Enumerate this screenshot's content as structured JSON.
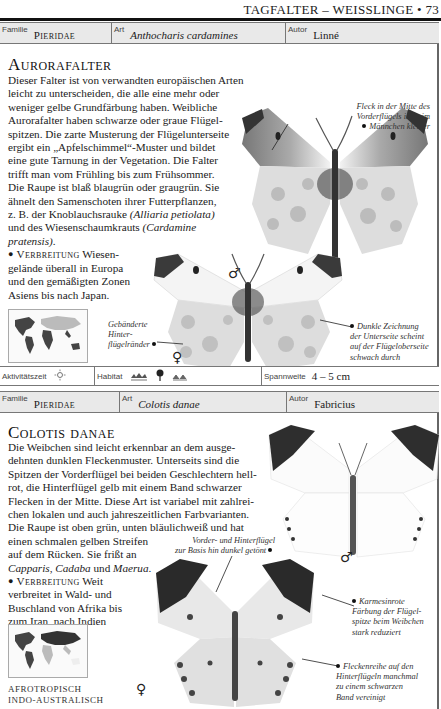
{
  "running_head": "TAGFALTER – WEISSLINGE • 73",
  "entries": [
    {
      "info_bar": {
        "familie_label": "Familie",
        "familie_value": "Pieridae",
        "art_label": "Art",
        "art_value": "Anthocharis cardamines",
        "autor_label": "Autor",
        "autor_value": "Linné"
      },
      "title": "Aurorafalter",
      "body_lines": [
        "Dieser Falter ist von verwandten europäischen Arten",
        "leicht zu unterscheiden, die alle eine mehr oder",
        "weniger gelbe Grundfärbung haben. Weibliche",
        "Aurorafalter haben schwarze oder graue Flügel-",
        "spitzen. Die zarte Musterung der Flügelunterseite",
        "ergibt ein „Apfelschimmel“-Muster und bildet",
        "eine gute Tarnung in der Vegetation. Die Falter",
        "trifft man vom Frühling bis zum Frühsommer.",
        "Die Raupe ist blaß blaugrün oder graugrün. Sie",
        "ähnelt den Samenschoten ihrer Futterpflanzen,"
      ],
      "body_line_11_pre": "z. B. der Knoblauchsrauke ",
      "body_line_11_ital": "(Alliaria petiolata)",
      "body_line_12_pre": "und des Wiesenschaumkrauts ",
      "body_line_12_ital": "(Cardamine",
      "body_line_13_ital": "pratensis)",
      "body_line_13_post": ".",
      "verbreitung_label": "Verbreitung",
      "verbreitung_lines": [
        " Wiesen-",
        "gelände überall in Europa",
        "und den gemäßigten Zonen",
        "Asiens bis nach Japan."
      ],
      "map_label_lines": [
        "PALÄARKTISCH"
      ],
      "captions": {
        "male_spot": [
          "Fleck in der Mitte des",
          "Vorderflügels ist beim",
          "Männchen kleiner"
        ],
        "hindwing_bands": [
          "Gebänderte",
          "Hinter-",
          "flügelränder"
        ],
        "dark_marking": [
          "Dunkle Zeichnung",
          "der Unterseite scheint",
          "auf der Flügeloberseite",
          "schwach durch"
        ]
      },
      "male_symbol": "♂",
      "female_symbol": "♀",
      "footer": {
        "aktivitaet_label": "Aktivitätszeit",
        "aktivitaet_icon": "sun-icon",
        "habitat_label": "Habitat",
        "habitat_icons": [
          "wetland-icon",
          "tree-icon",
          "grassland-icon"
        ],
        "spannweite_label": "Spannweite",
        "spannweite_value": "4 – 5 cm"
      }
    },
    {
      "info_bar": {
        "familie_label": "Familie",
        "familie_value": "Pieridae",
        "art_label": "Art",
        "art_value": "Colotis danae",
        "autor_label": "Autor",
        "autor_value": "Fabricius"
      },
      "title": "Colotis danae",
      "body_lines": [
        "Die Weibchen sind leicht erkennbar an dem ausge-",
        "dehnten dunklen Fleckenmuster. Unterseits sind die",
        "Spitzen der Vorderflügel bei beiden Geschlechtern hell-",
        "rot, die Hinterflügel gelb mit einem Band schwarzer",
        "Flecken in der Mitte. Diese Art ist variabel mit zahlrei-",
        "chen lokalen und auch jahreszeitlichen Farbvarianten.",
        "Die Raupe ist oben grün, unten bläulichweiß und hat",
        "einen schmalen gelben Streifen",
        "auf dem Rücken. Sie frißt an"
      ],
      "food_plants": [
        "Capparis",
        "Cadaba",
        "Maerua"
      ],
      "food_sep1": ", ",
      "food_sep2": " und ",
      "food_end": ".",
      "verbreitung_label": "Verbreitung",
      "verbreitung_lines": [
        " Weit",
        "verbreitet in Wald- und",
        "Buschland von Afrika bis",
        "zum Iran, nach Indien",
        "und Sri Lanka."
      ],
      "map_label_lines": [
        "AFROTROPISCH",
        "INDO-AUSTRALISCH"
      ],
      "captions": {
        "dark_base": [
          "Vorder- und Hinterflügel",
          "zur Basis hin dunkel getönt"
        ],
        "crimson_tip": [
          "Karmesinrote",
          "Färbung der Flügel-",
          "spitze beim Weibchen",
          "stark reduziert"
        ],
        "spot_row": [
          "Fleckenreihe auf den",
          "Hinterflügeln manchmal",
          "zu einem schwarzen",
          "Band vereinigt"
        ]
      },
      "male_symbol": "♂",
      "female_symbol": "♀"
    }
  ]
}
